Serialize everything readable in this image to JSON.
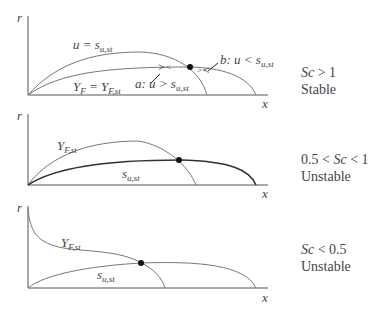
{
  "panels": [
    {
      "condition": "Sc > 1",
      "condition_var": "Sc",
      "condition_rest": " > 1",
      "stability": "Stable",
      "axis_y": "r",
      "axis_x": "x",
      "curve_labels": {
        "u": "u = s",
        "u_sub": "u,st",
        "yf": "Y",
        "yf_sub": "F",
        "yf_eq": " = Y",
        "yf_eq_sub": "F,st",
        "a": "a: u > s",
        "a_sub": "u,st",
        "b": "b: u < s",
        "b_sub": "u,st"
      }
    },
    {
      "condition_pre": "0.5 < ",
      "condition_var": "Sc",
      "condition_rest": " < 1",
      "stability": "Unstable",
      "axis_y": "r",
      "axis_x": "x",
      "curve_labels": {
        "yf": "Y",
        "yf_sub": "F,st",
        "s": "s",
        "s_sub": "u,st"
      }
    },
    {
      "condition_var": "Sc",
      "condition_rest": " < 0.5",
      "stability": "Unstable",
      "axis_y": "r",
      "axis_x": "x",
      "curve_labels": {
        "yf": "Y",
        "yf_sub": "F,st",
        "s": "s",
        "s_sub": "u,st"
      }
    }
  ]
}
